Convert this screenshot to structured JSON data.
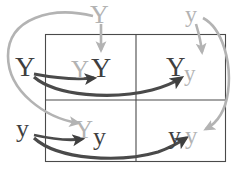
{
  "diagram": {
    "type": "punnett-square",
    "title_visible": false,
    "colors": {
      "maternal": "#b3b3b3",
      "paternal": "#3f3f3f",
      "grid_line": "#4a4a4a",
      "background": "#ffffff"
    },
    "parent_alleles": {
      "top": [
        {
          "id": "top-left",
          "label": "Y",
          "color_role": "maternal"
        },
        {
          "id": "top-right",
          "label": "y",
          "color_role": "maternal"
        }
      ],
      "left": [
        {
          "id": "left-top",
          "label": "Y",
          "color_role": "paternal"
        },
        {
          "id": "left-bottom",
          "label": "y",
          "color_role": "paternal"
        }
      ]
    },
    "cells": [
      {
        "id": "cell-top-left",
        "row": 0,
        "col": 0,
        "genotype": "YY",
        "first": {
          "label": "Y",
          "color_role": "maternal"
        },
        "second": {
          "label": "Y",
          "color_role": "paternal"
        }
      },
      {
        "id": "cell-top-right",
        "row": 0,
        "col": 1,
        "genotype": "Yy",
        "first": {
          "label": "Y",
          "color_role": "paternal"
        },
        "second": {
          "label": "y",
          "color_role": "maternal"
        }
      },
      {
        "id": "cell-bottom-left",
        "row": 1,
        "col": 0,
        "genotype": "Yy",
        "first": {
          "label": "Y",
          "color_role": "maternal"
        },
        "second": {
          "label": "y",
          "color_role": "paternal"
        }
      },
      {
        "id": "cell-bottom-right",
        "row": 1,
        "col": 1,
        "genotype": "yy",
        "first": {
          "label": "y",
          "color_role": "paternal"
        },
        "second": {
          "label": "y",
          "color_role": "maternal"
        }
      }
    ],
    "arrows": [
      {
        "id": "arrow-top-Y-to-top-left",
        "source": "top-left",
        "target": "cell-top-left",
        "color_role": "maternal",
        "shape": "short-down"
      },
      {
        "id": "arrow-top-Y-to-bottom-left",
        "source": "top-left",
        "target": "cell-bottom-left",
        "color_role": "maternal",
        "shape": "long-sweep-left"
      },
      {
        "id": "arrow-top-y-to-top-right",
        "source": "top-right",
        "target": "cell-top-right",
        "color_role": "maternal",
        "shape": "short-down"
      },
      {
        "id": "arrow-top-y-to-bottom-right",
        "source": "top-right",
        "target": "cell-bottom-right",
        "color_role": "maternal",
        "shape": "long-sweep-right"
      },
      {
        "id": "arrow-left-Y-to-top-left",
        "source": "left-top",
        "target": "cell-top-left",
        "color_role": "paternal",
        "shape": "short-right"
      },
      {
        "id": "arrow-left-Y-to-top-right",
        "source": "left-top",
        "target": "cell-top-right",
        "color_role": "paternal",
        "shape": "long-right"
      },
      {
        "id": "arrow-left-y-to-bottom-left",
        "source": "left-bottom",
        "target": "cell-bottom-left",
        "color_role": "paternal",
        "shape": "short-right"
      },
      {
        "id": "arrow-left-y-to-bottom-right",
        "source": "left-bottom",
        "target": "cell-bottom-right",
        "color_role": "paternal",
        "shape": "long-right"
      }
    ],
    "grid_geometry": {
      "left": 45,
      "top": 34,
      "right": 226,
      "bottom": 162,
      "v_divider_x": 136,
      "h_divider_y": 100
    }
  }
}
